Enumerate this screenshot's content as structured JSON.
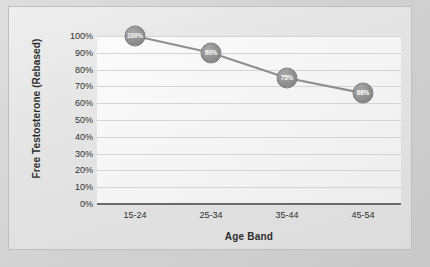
{
  "chart_data": {
    "type": "line",
    "title": "",
    "categories": [
      "15-24",
      "25-34",
      "35-44",
      "45-54"
    ],
    "values": [
      100,
      90,
      75,
      66
    ],
    "point_labels": [
      "100%",
      "90%",
      "75%",
      "66%"
    ],
    "xlabel": "Age Band",
    "ylabel": "Free Testosterone (Rebased)",
    "ylim": [
      0,
      100
    ],
    "ytick_labels": [
      "100%",
      "90%",
      "80%",
      "70%",
      "60%",
      "50%",
      "40%",
      "30%",
      "20%",
      "10%",
      "0%"
    ],
    "ytick_values": [
      100,
      90,
      80,
      70,
      60,
      50,
      40,
      30,
      20,
      10,
      0
    ],
    "grid": true,
    "legend": "none",
    "series_color": "#8f8f8f",
    "gridline_color": "#d4d4d4",
    "axis_color": "#6a6a6a",
    "label_color": "#2e2e2e",
    "marker_label_color": "#ffffff"
  }
}
